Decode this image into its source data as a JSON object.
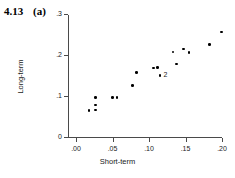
{
  "figure": {
    "number": "4.13",
    "panel": "(a)"
  },
  "chart_data": {
    "type": "scatter",
    "title": "",
    "xlabel": "Short-term",
    "ylabel": "Long-term",
    "xlim": [
      -0.0075,
      0.2125
    ],
    "ylim": [
      -0.0055,
      0.3
    ],
    "grid": false,
    "legend": null,
    "xticks": [
      0.0,
      0.05,
      0.1,
      0.15,
      0.2
    ],
    "xticklabels": [
      ".00",
      ".05",
      ".10",
      ".15",
      ".20"
    ],
    "yticks": [
      0.0,
      0.1,
      0.2,
      0.3
    ],
    "yticklabels": [
      "0",
      ".1",
      ".2",
      ".3"
    ],
    "points": [
      {
        "x": 0.018,
        "y": 0.064
      },
      {
        "x": 0.027,
        "y": 0.097
      },
      {
        "x": 0.027,
        "y": 0.078
      },
      {
        "x": 0.027,
        "y": 0.066
      },
      {
        "x": 0.05,
        "y": 0.096
      },
      {
        "x": 0.056,
        "y": 0.096
      },
      {
        "x": 0.077,
        "y": 0.126
      },
      {
        "x": 0.083,
        "y": 0.158
      },
      {
        "x": 0.106,
        "y": 0.168
      },
      {
        "x": 0.112,
        "y": 0.169
      },
      {
        "x": 0.115,
        "y": 0.15
      },
      {
        "x": 0.133,
        "y": 0.207
      },
      {
        "x": 0.138,
        "y": 0.178
      },
      {
        "x": 0.147,
        "y": 0.215
      },
      {
        "x": 0.155,
        "y": 0.206
      },
      {
        "x": 0.183,
        "y": 0.226
      },
      {
        "x": 0.199,
        "y": 0.256
      }
    ],
    "annotations": [
      {
        "text": "2",
        "x": 0.12,
        "y": 0.152
      }
    ]
  }
}
